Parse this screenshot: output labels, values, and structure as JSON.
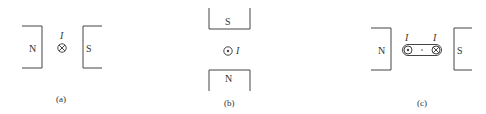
{
  "panels": [
    {
      "id": "a",
      "caption": "(a)",
      "left_pole": "N",
      "right_pole": "S",
      "current_label": "I",
      "current_symbol": "cross-into-page",
      "description": "Current into page between N (left) and S (right) poles"
    },
    {
      "id": "b",
      "caption": "(b)",
      "top_pole": "S",
      "bottom_pole": "N",
      "current_label": "I",
      "current_symbol": "dot-out-of-page",
      "description": "Current out of page between S (top) and N (bottom) poles"
    },
    {
      "id": "c",
      "caption": "(c)",
      "left_pole": "N",
      "right_pole": "S",
      "coil_left_label": "I",
      "coil_right_label": "I",
      "coil_left_symbol": "dot-out-of-page",
      "coil_right_symbol": "cross-into-page",
      "description": "Current loop with out-of-page (left) and into-page (right) sides between N and S poles"
    }
  ],
  "colors": {
    "ink": "#444444",
    "background": "#ffffff"
  }
}
